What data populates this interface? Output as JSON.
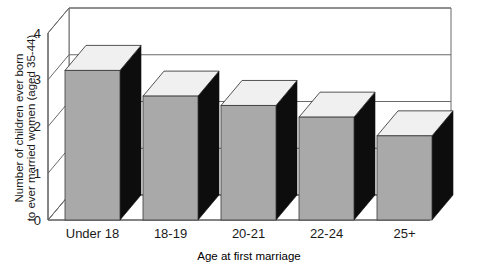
{
  "chart_data": {
    "type": "bar",
    "title": "",
    "subtitle": "",
    "categories": [
      "Under 18",
      "18-19",
      "20-21",
      "22-24",
      "25+"
    ],
    "values": [
      3.2,
      2.65,
      2.45,
      2.2,
      1.8
    ],
    "series": [
      {
        "name": "Number of children ever born",
        "values": [
          3.2,
          2.65,
          2.45,
          2.2,
          1.8
        ]
      }
    ],
    "xlabel": "Age at first marriage",
    "ylabel_line1": "Number of children ever born",
    "ylabel_line2": "to ever married women (aged 35-44)",
    "ylabel": "Number of children ever born to ever married women (aged 35-44)",
    "ylim": [
      0,
      4
    ],
    "ytick_labels": [
      "0",
      "1",
      "2",
      "3",
      "4"
    ],
    "ytick_values": [
      0,
      1,
      2,
      3,
      4
    ],
    "grid": true,
    "grid_axis": "y",
    "legend": false,
    "legend_position": "none",
    "style": "3d-bar",
    "colors": {
      "bar_front": "#a9a9a9",
      "bar_top": "#f0f0f0",
      "bar_side": "#0d0d0d",
      "axis": "#555555",
      "grid": "#6a6a6a",
      "text": "#1a1a1a",
      "background": "#ffffff"
    },
    "annotations": []
  }
}
